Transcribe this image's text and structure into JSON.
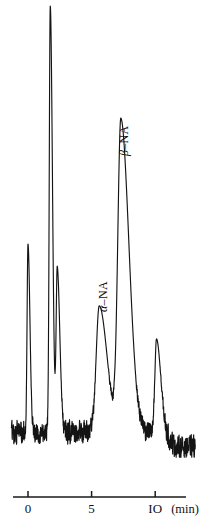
{
  "chart_data": {
    "type": "line",
    "title": "",
    "subtitle": "",
    "xlabel": "(min)",
    "ylabel": "",
    "xlim": [
      -1.3,
      13.2
    ],
    "ylim": [
      0,
      100
    ],
    "grid": false,
    "legend": null,
    "x_ticks": [
      0,
      5,
      10
    ],
    "x_tick_labels": [
      "0",
      "5",
      "IO"
    ],
    "axis_unit": "(min)",
    "baseline_level": 6,
    "baseline_level_late": 2.5,
    "noise_amplitude": 2.2,
    "annotations": [
      {
        "id": "alpha-na",
        "text_prefix": "α",
        "text_suffix": "–NA",
        "text": "α–NA",
        "rotation_deg": -90,
        "x_px": 96,
        "y_px": 312,
        "target_peak": "alpha-NA"
      },
      {
        "id": "beta-na",
        "text_prefix": "β",
        "text_suffix": "–NA",
        "text": "β–NA",
        "rotation_deg": -90,
        "x_px": 117,
        "y_px": 156,
        "target_peak": "beta-NA"
      }
    ],
    "peaks": [
      {
        "name": "solvent-front",
        "retention_min": 0.0,
        "height": 42.5,
        "width_min": 0.1,
        "tail": 0.05,
        "label": ""
      },
      {
        "name": "main-unknown",
        "retention_min": 1.75,
        "height": 96.5,
        "width_min": 0.11,
        "tail": 0.06,
        "label": ""
      },
      {
        "name": "shoulder",
        "retention_min": 2.3,
        "height": 37.0,
        "width_min": 0.12,
        "tail": 0.08,
        "label": ""
      },
      {
        "name": "alpha-NA",
        "retention_min": 5.6,
        "height": 28.5,
        "width_min": 0.33,
        "tail": 0.28,
        "label": "α–NA"
      },
      {
        "name": "beta-NA",
        "retention_min": 7.3,
        "height": 70.5,
        "width_min": 0.33,
        "tail": 0.3,
        "label": "β–NA"
      },
      {
        "name": "late-minor",
        "retention_min": 10.1,
        "height": 21.0,
        "width_min": 0.17,
        "tail": 0.16,
        "label": ""
      }
    ],
    "series": [
      {
        "name": "detector-signal",
        "color": "#141414",
        "x": [
          0.0,
          1.75,
          2.3,
          5.6,
          7.3,
          10.1
        ],
        "values": [
          42.5,
          96.5,
          37.0,
          28.5,
          70.5,
          21.0
        ]
      }
    ],
    "axis_line": {
      "x_start_px": 13,
      "x_end_px": 186,
      "y_px": 497,
      "color": "#1a1a1a"
    },
    "trace_color": "#141414",
    "background_color": "#ffffff"
  },
  "figure": {
    "caption": "",
    "axis_unit": "(min)"
  }
}
